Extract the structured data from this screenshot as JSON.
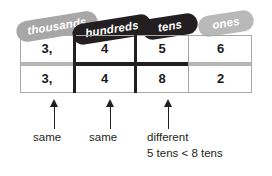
{
  "diagram": {
    "colors": {
      "pill_gray": "#a7a7a7",
      "pill_dark": "#231f20",
      "pill_light": "#b9b9b9",
      "rule_gray": "#a9a9a9",
      "rule_black": "#231f20",
      "text": "#231f20"
    },
    "headers": [
      {
        "label": "thousands",
        "style": "gray"
      },
      {
        "label": "hundreds",
        "style": "dark"
      },
      {
        "label": "tens",
        "style": "dark"
      },
      {
        "label": "ones",
        "style": "light"
      }
    ],
    "rows": [
      {
        "cells": [
          "3,",
          "4",
          "5",
          "6"
        ]
      },
      {
        "cells": [
          "3,",
          "4",
          "8",
          "2"
        ]
      }
    ],
    "annotations": [
      {
        "label": "same",
        "detail": ""
      },
      {
        "label": "same",
        "detail": ""
      },
      {
        "label": "different",
        "detail": "5 tens < 8 tens"
      }
    ]
  }
}
